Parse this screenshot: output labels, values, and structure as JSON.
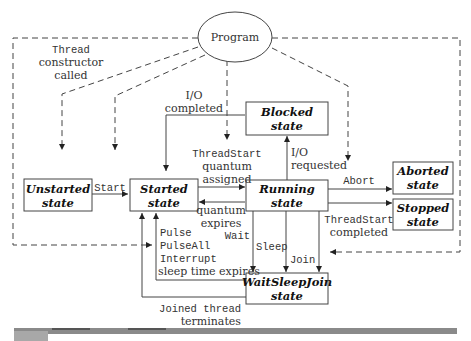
{
  "diagram": {
    "program_node": {
      "label": "Program"
    },
    "states": {
      "unstarted": {
        "line1": "Unstarted",
        "line2": "state"
      },
      "started": {
        "line1": "Started",
        "line2": "state"
      },
      "running": {
        "line1": "Running",
        "line2": "state"
      },
      "blocked": {
        "line1": "Blocked",
        "line2": "state"
      },
      "aborted": {
        "line1": "Aborted",
        "line2": "state"
      },
      "stopped": {
        "line1": "Stopped",
        "line2": "state"
      },
      "waitsleepjoin": {
        "line1": "WaitSleepJoin",
        "line2": "state"
      }
    },
    "transitions": {
      "thread_constructor": {
        "line1": "Thread",
        "line2": "constructor",
        "line3": "called"
      },
      "start": {
        "label": "Start"
      },
      "io_completed": {
        "line1": "I/O",
        "line2": "completed"
      },
      "threadstart_assigned": {
        "line1": "ThreadStart",
        "line2": "quantum",
        "line3": "assigned"
      },
      "io_requested": {
        "line1": "I/O",
        "line2": "requested"
      },
      "abort": {
        "label": "Abort"
      },
      "quantum_expires": {
        "line1": "quantum",
        "line2": "expires"
      },
      "threadstart_completed": {
        "line1": "ThreadStart",
        "line2": "completed"
      },
      "wait": {
        "label": "Wait"
      },
      "sleep": {
        "label": "Sleep"
      },
      "join": {
        "label": "Join"
      },
      "pulse": {
        "label": "Pulse"
      },
      "pulseall": {
        "label": "PulseAll"
      },
      "interrupt": {
        "label": "Interrupt"
      },
      "sleep_time_expires": {
        "label": "sleep time expires"
      },
      "joined_thread": {
        "line1": "Joined thread",
        "line2": "terminates"
      }
    }
  },
  "colors": {
    "line": "#444444",
    "text": "#333333",
    "footer_bar": "#8a8a8a"
  }
}
